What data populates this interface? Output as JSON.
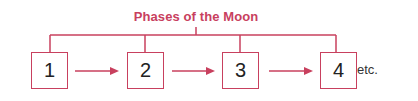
{
  "diagram": {
    "title": "Phases of the Moon",
    "boxes": [
      {
        "label": "1"
      },
      {
        "label": "2"
      },
      {
        "label": "3"
      },
      {
        "label": "4"
      }
    ],
    "trailing_text": "etc.",
    "colors": {
      "accent": "#c8405e",
      "text": "#222222"
    }
  }
}
